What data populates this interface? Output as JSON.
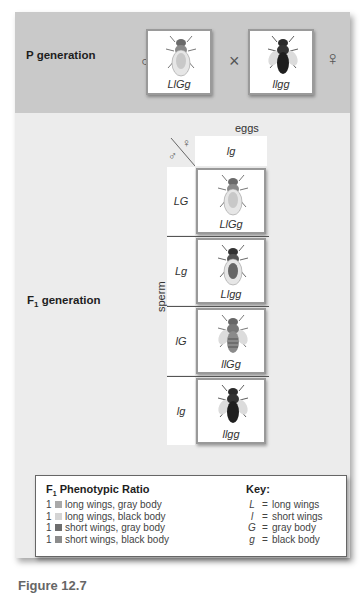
{
  "p_generation": {
    "label": "P generation",
    "male_symbol": "♂",
    "female_symbol": "♀",
    "cross_symbol": "×",
    "male_parent": {
      "genotype": "LlGg",
      "phenotype": "long wings, gray body"
    },
    "female_parent": {
      "genotype": "llgg",
      "phenotype": "short wings, black body"
    }
  },
  "f1_generation": {
    "label_prefix": "F",
    "label_sub": "1",
    "label_suffix": " generation",
    "eggs_label": "eggs",
    "sperm_label": "sperm",
    "offspring_label": "offspring",
    "corner_male": "♂",
    "corner_female": "♀",
    "egg_alleles": [
      "lg"
    ],
    "rows": [
      {
        "sperm": "LG",
        "offspring": "LlGg",
        "phenotype": "long wings, gray body"
      },
      {
        "sperm": "Lg",
        "offspring": "Llgg",
        "phenotype": "long wings, black body"
      },
      {
        "sperm": "lG",
        "offspring": "llGg",
        "phenotype": "short wings, gray body"
      },
      {
        "sperm": "lg",
        "offspring": "llgg",
        "phenotype": "short wings, black body"
      }
    ]
  },
  "ratio": {
    "title_prefix": "F",
    "title_sub": "1",
    "title_suffix": " Phenotypic Ratio",
    "items": [
      {
        "count": "1",
        "label": "long wings, gray body",
        "color": "#a9a9a9"
      },
      {
        "count": "1",
        "label": "long wings, black body",
        "color": "#d4d4d4"
      },
      {
        "count": "1",
        "label": "short wings, gray body",
        "color": "#6e6e6e"
      },
      {
        "count": "1",
        "label": "short wings, black body",
        "color": "#8c8c8c"
      }
    ]
  },
  "key": {
    "title": "Key:",
    "items": [
      {
        "symbol": "L",
        "eq": "=",
        "meaning": "long wings"
      },
      {
        "symbol": "l",
        "eq": "=",
        "meaning": "short wings"
      },
      {
        "symbol": "G",
        "eq": "=",
        "meaning": "gray body"
      },
      {
        "symbol": "g",
        "eq": "=",
        "meaning": "black body"
      }
    ]
  },
  "caption": "Figure 12.7",
  "colors": {
    "p_band": "#c9c9c9",
    "panel": "#ececec",
    "cell_border": "#999999"
  }
}
